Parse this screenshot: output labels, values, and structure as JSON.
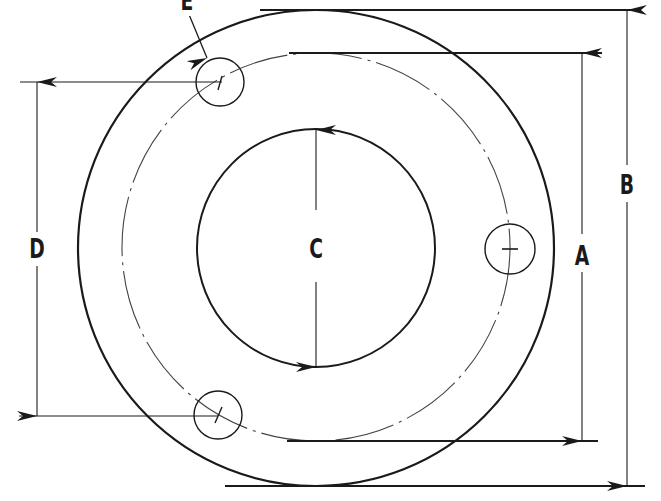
{
  "diagram": {
    "type": "flange dimension drawing",
    "labels": {
      "A": "A",
      "B": "B",
      "C": "C",
      "D": "D",
      "E": "E"
    },
    "dimensions": [
      {
        "label": "A",
        "meaning": "bolt circle diameter"
      },
      {
        "label": "B",
        "meaning": "outside diameter"
      },
      {
        "label": "C",
        "meaning": "inside (bore) diameter"
      },
      {
        "label": "D",
        "meaning": "distance between bolt hole centers"
      },
      {
        "label": "E",
        "meaning": "bolt hole"
      }
    ],
    "bolt_hole_count": 3,
    "colors": {
      "line": "#1a1a1a",
      "thin_line": "#333333",
      "background": "#ffffff"
    }
  }
}
